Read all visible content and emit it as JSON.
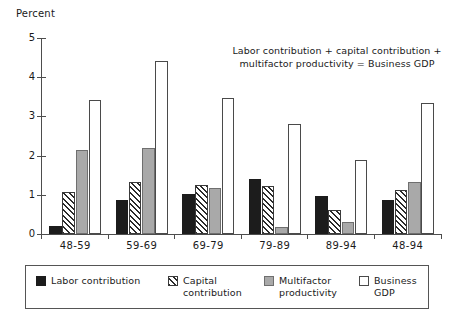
{
  "chart_data": {
    "type": "bar",
    "title": "",
    "subtitle": "",
    "xlabel": "",
    "ylabel": "Percent",
    "categories": [
      "48-59",
      "59-69",
      "69-79",
      "79-89",
      "89-94",
      "48-94"
    ],
    "series": [
      {
        "name": "Labor contribution",
        "key": "labor",
        "values": [
          0.2,
          0.88,
          1.03,
          1.4,
          0.96,
          0.88
        ]
      },
      {
        "name": "Capital contribution",
        "key": "capital",
        "values": [
          1.08,
          1.32,
          1.24,
          1.22,
          0.6,
          1.13
        ]
      },
      {
        "name": "Multifactor productivity",
        "key": "mfp",
        "values": [
          2.14,
          2.2,
          1.17,
          0.18,
          0.3,
          1.32
        ]
      },
      {
        "name": "Business GDP",
        "key": "gdp",
        "values": [
          3.42,
          4.41,
          3.46,
          2.81,
          1.88,
          3.35
        ]
      }
    ],
    "ylim": [
      0,
      5
    ],
    "yticks": [
      0,
      1,
      2,
      3,
      4,
      5
    ],
    "ytick_labels": [
      "0",
      "1",
      "2",
      "3",
      "4",
      "5"
    ],
    "grid": false,
    "legend_position": "bottom",
    "annotation": "Labor contribution + capital contribution +\nmultifactor productivity = Business GDP"
  },
  "legend": {
    "entries": [
      {
        "label": "Labor contribution",
        "key": "labor",
        "swatch": "solid-black-swatch"
      },
      {
        "label": "Capital\ncontribution",
        "key": "capital",
        "swatch": "hatched-swatch"
      },
      {
        "label": "Multifactor\nproductivity",
        "key": "mfp",
        "swatch": "solid-gray-swatch"
      },
      {
        "label": "Business GDP",
        "key": "gdp",
        "swatch": "outline-white-swatch"
      }
    ]
  },
  "colors": {
    "labor": "#1c1c1c",
    "capital": "#ffffff",
    "mfp": "#a9a9a9",
    "gdp": "#ffffff",
    "axis": "#4d4d4d",
    "text": "#1a1a1a"
  }
}
